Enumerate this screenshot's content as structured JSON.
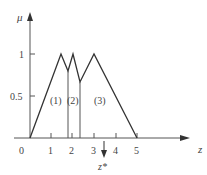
{
  "diagram": {
    "y_axis_label": "μ",
    "x_axis_label": "z",
    "y_ticks": [
      {
        "label": "1",
        "value": 1
      },
      {
        "label": "0.5",
        "value": 0.5
      }
    ],
    "x_ticks": [
      {
        "label": "0",
        "value": 0
      },
      {
        "label": "1",
        "value": 1
      },
      {
        "label": "2",
        "value": 2
      },
      {
        "label": "3",
        "value": 3
      },
      {
        "label": "4",
        "value": 4
      },
      {
        "label": "5",
        "value": 5
      }
    ],
    "regions": [
      {
        "label": "(1)"
      },
      {
        "label": "(2)"
      },
      {
        "label": "(3)"
      }
    ],
    "defuzzified_marker": {
      "label": "z*"
    },
    "membership_outline": [
      [
        0,
        0
      ],
      [
        1.5,
        1
      ],
      [
        1.8,
        0.8
      ],
      [
        2,
        1
      ],
      [
        2.33,
        0.67
      ],
      [
        3,
        1
      ],
      [
        5,
        0
      ]
    ],
    "colors": {
      "line": "#333333",
      "axis": "#555555",
      "text": "#444444"
    }
  }
}
